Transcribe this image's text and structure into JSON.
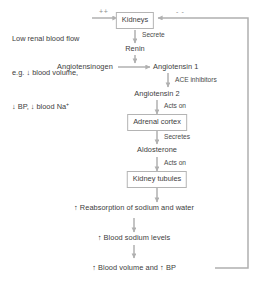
{
  "diagram": {
    "colors": {
      "background": "#ffffff",
      "text": "#3c3c3c",
      "arrow": "#b0b0b0",
      "box_border": "#b4b4b4",
      "sign": "#8e8e8e"
    },
    "stimulus": {
      "line1": "Low renal blood flow",
      "line2": "e.g. ↓ blood volume,",
      "line3": "↓ BP, ↓ blood Na"
    },
    "nodes": {
      "kidneys": "Kidneys",
      "renin": "Renin",
      "angiotensinogen": "Angiotensinogen",
      "angiotensin1": "Angiotensin 1",
      "angiotensin2": "Angiotensin 2",
      "adrenal_cortex": "Adrenal cortex",
      "aldosterone": "Aldosterone",
      "kidney_tubules": "Kidney tubules",
      "reabsorption": "↑ Reabsorption of sodium and water",
      "blood_sodium": "↑ Blood sodium levels",
      "blood_volume_bp": "↑ Blood volume and ↑ BP"
    },
    "edge_labels": {
      "secrete": "Secrete",
      "ace_inhibitors": "ACE inhibitors",
      "acts_on_adrenal": "Acts on",
      "secretes": "Secretes",
      "acts_on_tubules": "Acts on"
    },
    "signs": {
      "stimulatory": "++",
      "inhibitory": "- -"
    }
  }
}
